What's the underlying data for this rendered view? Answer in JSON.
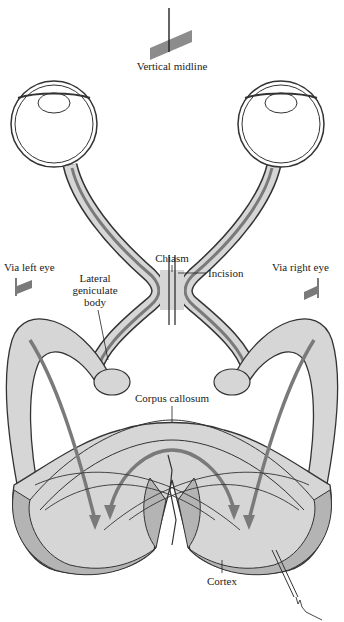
{
  "figure": {
    "type": "anatomical-diagram",
    "colors": {
      "background": "#ffffff",
      "tissue_fill": "#d6d6d6",
      "cortex_fill": "#b4b4b4",
      "pathway_stroke": "#7a7a7a",
      "outline": "#333333",
      "midline_bar": "#8c8c8c"
    }
  },
  "labels": {
    "vertical_midline": "Vertical midline",
    "chiasm": "Chiasm",
    "incision": "Incision",
    "via_left_eye": "Via left eye",
    "via_right_eye": "Via right eye",
    "lateral_geniculate_1": "Lateral",
    "lateral_geniculate_2": "geniculate",
    "lateral_geniculate_3": "body",
    "corpus_callosum": "Corpus callosum",
    "cortex": "Cortex"
  }
}
